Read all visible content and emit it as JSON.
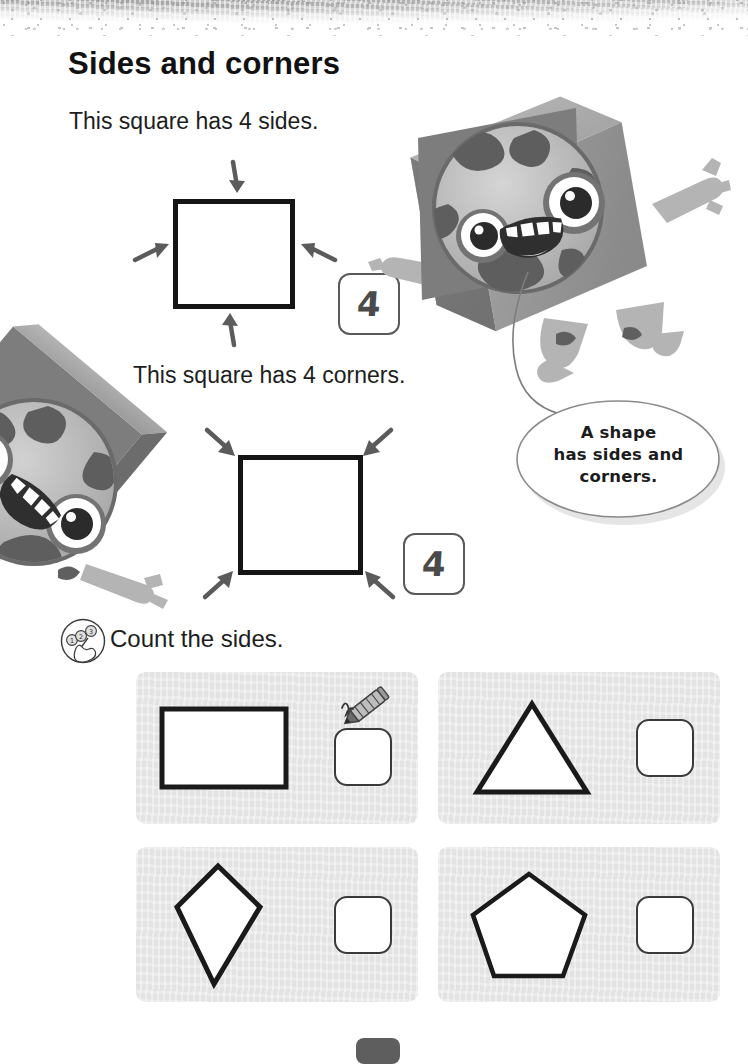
{
  "page": {
    "title": "Sides and corners",
    "page_tab_label": ""
  },
  "lesson": {
    "statement_sides": "This square has 4 sides.",
    "statement_corners": "This square has 4 corners.",
    "sides_answer": "4",
    "corners_answer": "4",
    "sides_diagram": {
      "shape": "square",
      "arrow_count": 4,
      "arrow_targets": [
        "top side",
        "bottom side",
        "left side",
        "right side"
      ]
    },
    "corners_diagram": {
      "shape": "square",
      "arrow_count": 4,
      "arrow_targets": [
        "top-left corner",
        "top-right corner",
        "bottom-left corner",
        "bottom-right corner"
      ]
    }
  },
  "speech_bubble": {
    "line1": "A shape",
    "line2": "has sides and",
    "line3": "corners."
  },
  "task": {
    "icon": "count-fingers-icon",
    "instruction": "Count the sides.",
    "panels": [
      {
        "shape": "rectangle",
        "sides": 4,
        "answer": "",
        "has_pencil_icon": true
      },
      {
        "shape": "triangle",
        "sides": 3,
        "answer": "",
        "has_pencil_icon": false
      },
      {
        "shape": "kite",
        "sides": 4,
        "answer": "",
        "has_pencil_icon": false
      },
      {
        "shape": "pentagon",
        "sides": 5,
        "answer": "",
        "has_pencil_icon": false
      }
    ]
  },
  "characters": [
    {
      "name": "cube-monster-top-right",
      "description": "cube-bodied spotted monster waving"
    },
    {
      "name": "cube-monster-left",
      "description": "rotated cube-bodied spotted monster at left edge"
    }
  ],
  "colors": {
    "ink": "#151515",
    "panel_background": "#e3e3e3",
    "badge_outline": "#5a5a5a",
    "monster_body": "#8e8e8e",
    "page_tab": "#5e5e5e"
  }
}
